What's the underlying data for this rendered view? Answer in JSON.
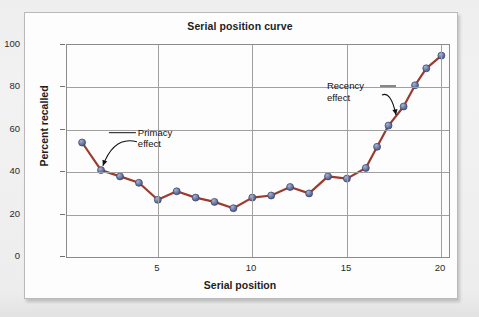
{
  "figure": {
    "card_background": "#fdfdfd",
    "border_color": "#b9b9b9",
    "page_background": "#efefef"
  },
  "chart_data": {
    "type": "line",
    "title": "Serial position curve",
    "xlabel": "Serial position",
    "ylabel": "Percent recalled",
    "xlim": [
      0.2,
      20.4
    ],
    "ylim": [
      0,
      100
    ],
    "xticks": [
      5,
      10,
      15,
      20
    ],
    "xtick_labels": [
      "5",
      "10",
      "15",
      "20"
    ],
    "yticks": [
      0,
      20,
      40,
      60,
      80,
      100
    ],
    "ytick_labels": [
      "0",
      "20",
      "40",
      "60",
      "80",
      "100"
    ],
    "grid": "both",
    "legend": "none",
    "line_color": "#9b3b2e",
    "marker_color": "#6d7ea8",
    "marker_edge_color": "#39406b",
    "x": [
      1,
      2,
      3,
      4,
      5,
      6,
      7,
      8,
      9,
      10,
      11,
      12,
      13,
      14,
      15,
      16,
      16.6,
      17.2,
      18,
      18.6,
      19.2,
      20
    ],
    "values": [
      54,
      41,
      38,
      35,
      27,
      31,
      28,
      26,
      23,
      28,
      29,
      33,
      30,
      38,
      37,
      42,
      52,
      62,
      71,
      81,
      89,
      95
    ],
    "series": [
      {
        "name": "Percent recalled",
        "values": [
          54,
          41,
          38,
          35,
          27,
          31,
          28,
          26,
          23,
          28,
          29,
          33,
          30,
          38,
          37,
          42,
          52,
          62,
          71,
          81,
          89,
          95
        ]
      }
    ],
    "annotations": [
      {
        "id": "primacy",
        "text": "Primacy\neffect",
        "label_x": 4.0,
        "label_y": 61,
        "arrow_to_x": 2.1,
        "arrow_to_y": 43
      },
      {
        "id": "recency",
        "text": "Recency\neffect",
        "label_x": 14.0,
        "label_y": 83,
        "arrow_to_x": 17.6,
        "arrow_to_y": 67
      }
    ]
  }
}
